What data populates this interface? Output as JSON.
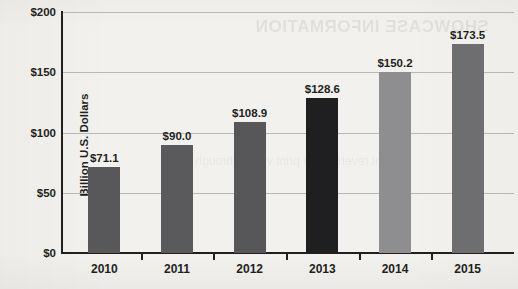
{
  "chart_data": {
    "type": "bar",
    "title": "",
    "xlabel": "",
    "ylabel": "Billion U.S. Dollars",
    "categories": [
      "2010",
      "2011",
      "2012",
      "2013",
      "2014",
      "2015"
    ],
    "values": [
      71.1,
      90.0,
      108.9,
      128.6,
      150.2,
      173.5
    ],
    "data_labels": [
      "$71.1",
      "$90.0",
      "$108.9",
      "$128.6",
      "$150.2",
      "$173.5"
    ],
    "bar_colors": [
      "#58585a",
      "#5a5a5c",
      "#57575a",
      "#1f1f21",
      "#8e8e90",
      "#6e6e70"
    ],
    "ylim": [
      0,
      200
    ],
    "ytick_values": [
      0,
      50,
      100,
      150,
      200
    ],
    "ytick_labels": [
      "$0",
      "$50",
      "$100",
      "$150",
      "$200"
    ],
    "grid": true,
    "legend": null,
    "legend_position": "none"
  },
  "background": {
    "paper_color": "#f2f1ee",
    "axis_color": "#231f20",
    "grid_color": "#b9b7b4",
    "bleed_through_text": "SHOWCASE INFORMATION",
    "bleed_through_text_2": "faint reverse side print visible through page"
  }
}
